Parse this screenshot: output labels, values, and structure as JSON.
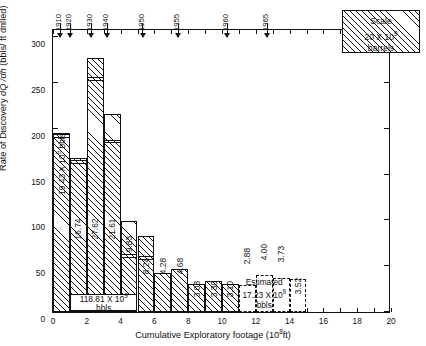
{
  "chart_data": {
    "type": "bar",
    "title": "",
    "xlabel": "Cumulative Exploratory footage (10^8 ft)",
    "ylabel": "Rate of Discovery dQ/dh (bbls/ft drilled)",
    "xlim": [
      0,
      20
    ],
    "ylim": [
      0,
      310
    ],
    "xtick_step": 1,
    "xtick_labeled_step": 2,
    "ytick_step": 50,
    "grid": false,
    "legend_position": "top-right",
    "bar_width_units": 1,
    "categories": [
      "0-1",
      "1-2",
      "2-3",
      "3-4",
      "4-5",
      "5-6",
      "6-7",
      "7-8",
      "8-9",
      "9-10",
      "10-11",
      "11-12",
      "12-13",
      "13-14",
      "14-15"
    ],
    "x_left_edges": [
      0,
      1,
      2,
      3,
      4,
      5,
      6,
      7,
      8,
      9,
      10,
      11,
      12,
      13,
      14
    ],
    "values": [
      195.0,
      168.0,
      277.5,
      216.5,
      99.0,
      83.0,
      43.0,
      47.0,
      31.0,
      33.5,
      31.0,
      29.0,
      40.5,
      37.5,
      35.5
    ],
    "inner_segment_values": [
      190.0,
      161.5,
      252.5,
      184.0,
      59.0,
      57.0,
      null,
      null,
      null,
      null,
      null,
      null,
      null,
      null,
      null
    ],
    "bar_labels": [
      "19.43",
      "16.74",
      "27.62",
      "21.61",
      "9.83",
      "8.24",
      "4.28",
      "4.68",
      "3.08",
      "3.30",
      "3.10",
      "2.88",
      "4.00",
      "3.73",
      "3.52"
    ],
    "bar_label_unit": "x 10^9 bbls",
    "estimated_bars": [
      11,
      12,
      13,
      14
    ]
  },
  "axes": {
    "y_ticks": [
      "0",
      "50",
      "100",
      "150",
      "200",
      "250",
      "300"
    ],
    "y_tick_values": [
      0,
      50,
      100,
      150,
      200,
      250,
      300
    ],
    "x_ticks": [
      "0",
      "2",
      "4",
      "6",
      "8",
      "10",
      "12",
      "14",
      "16",
      "18",
      "20"
    ],
    "x_tick_values": [
      0,
      2,
      4,
      6,
      8,
      10,
      12,
      14,
      16,
      18,
      20
    ],
    "x_title_main": "Cumulative  Exploratory  footage (10",
    "x_title_exp": "8",
    "x_title_tail": "ft)",
    "y_title_a": "Rate of  Discovery  ",
    "y_title_b": "dQ /dh",
    "y_title_c": "  (bbls/ ft drilled)"
  },
  "year_arrows": [
    {
      "label": "1910",
      "x": 0.45
    },
    {
      "label": "1920",
      "x": 1.05
    },
    {
      "label": "1930",
      "x": 2.28
    },
    {
      "label": "1940",
      "x": 3.25
    },
    {
      "label": "1950",
      "x": 5.35
    },
    {
      "label": "1955",
      "x": 7.45
    },
    {
      "label": "1960",
      "x": 10.35
    },
    {
      "label": "1965",
      "x": 12.7
    }
  ],
  "legend": {
    "line1": "Scale",
    "line2_pre": "20 X 10",
    "line2_exp": "9",
    "line3": "barrels"
  },
  "cumulative_box": {
    "text_pre": "118.81 X 10",
    "text_exp": "9",
    "text_post": " bbls"
  },
  "first_bar_label": {
    "text_pre": "19.43 X 10",
    "text_exp": "9",
    "text_post": " bbls"
  },
  "estimated_caption": {
    "line1": "Estimated",
    "line2_pre": "17.23 X 10",
    "line2_exp": "9",
    "line3": "bbls"
  }
}
